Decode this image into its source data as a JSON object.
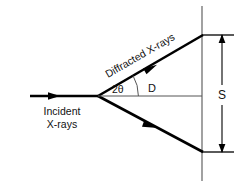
{
  "figure": {
    "type": "xrd-geometry-diagram",
    "background_color": "#ffffff",
    "ink_color": "#000000",
    "thin_line_color": "#555555"
  },
  "labels": {
    "incident_line1": "Incident",
    "incident_line2": "X-rays",
    "diffracted": "Diffracted X-rays",
    "two_theta": "2θ",
    "distance_D": "D",
    "separation_S": "S"
  },
  "geometry": {
    "vertex_x": 98,
    "vertex_y": 96,
    "incident_start_x": 30,
    "incident_arrow_x": 57,
    "detector_line_x": 202,
    "detector_top_y": 6,
    "detector_bottom_y": 180,
    "upper_ray_end_x": 202,
    "upper_ray_end_y": 35,
    "lower_ray_end_x": 202,
    "lower_ray_end_y": 152,
    "dim_line_x": 222,
    "tick_right_x": 234,
    "arc_radius": 42,
    "two_theta_degrees": 30
  }
}
